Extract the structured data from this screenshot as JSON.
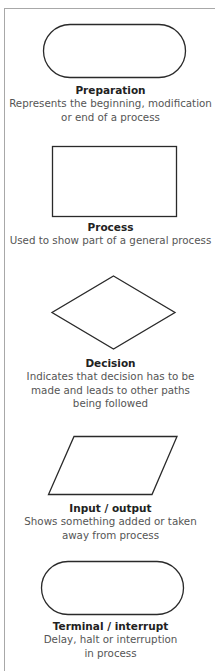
{
  "colors": {
    "shape_stroke": "#2a2a2a",
    "title_text": "#222222",
    "description_text": "#555555",
    "frame_border": "#a8a8a8",
    "background": "#ffffff"
  },
  "legend": [
    {
      "shape": "stadium",
      "title": "Preparation",
      "description": "Represents the beginning, modification\nor end of a process"
    },
    {
      "shape": "rectangle",
      "title": "Process",
      "description": "Used to show part of a general process"
    },
    {
      "shape": "diamond",
      "title": "Decision",
      "description": "Indicates that decision has to be\nmade and leads to other paths\nbeing followed"
    },
    {
      "shape": "parallelogram",
      "title": "Input / output",
      "description": "Shows something added or taken\naway from process"
    },
    {
      "shape": "stadium",
      "title": "Terminal / interrupt",
      "description": "Delay, halt or interruption\nin process"
    }
  ]
}
